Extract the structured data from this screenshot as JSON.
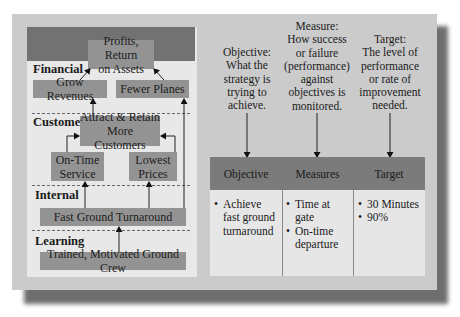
{
  "strategy_map": {
    "top_objective": "Profits, Return on Assets",
    "perspectives": [
      {
        "label": "Financial"
      },
      {
        "label": "Customer"
      },
      {
        "label": "Internal"
      },
      {
        "label": "Learning"
      }
    ],
    "boxes": {
      "profits_line1": "Profits, Return",
      "profits_line2": "on Assets",
      "grow_revenues": "Grow Revenues",
      "fewer_planes": "Fewer Planes",
      "attract_line1": "Attract & Retain",
      "attract_line2": "More Customers",
      "ontime_line1": "On-Time",
      "ontime_line2": "Service",
      "lowest_line1": "Lowest",
      "lowest_line2": "Prices",
      "fast_ground": "Fast Ground Turnaround",
      "trained_crew": "Trained, Motivated Ground Crew"
    }
  },
  "descriptions": {
    "objective": [
      "Objective:",
      "What the",
      "strategy is",
      "trying to",
      "achieve."
    ],
    "measure": [
      "Measure:",
      "How success",
      "or failure",
      "(performance)",
      "against",
      "objectives is",
      "monitored."
    ],
    "target": [
      "Target:",
      "The level of",
      "performance",
      "or rate of",
      "improvement",
      "needed."
    ]
  },
  "table": {
    "headers": [
      "Objective",
      "Measures",
      "Target"
    ],
    "objective_items": [
      "Achieve fast ground turnaround"
    ],
    "measures_items": [
      "Time at gate",
      "On-time departure"
    ],
    "target_items": [
      "30 Minutes",
      "90%"
    ]
  },
  "colors": {
    "outer_panel": "#cbcbcb",
    "inner_panel": "#e8e8e8",
    "dark_bar": "#727272",
    "box_fill": "#939393",
    "table_body": "#e6e6e6"
  }
}
